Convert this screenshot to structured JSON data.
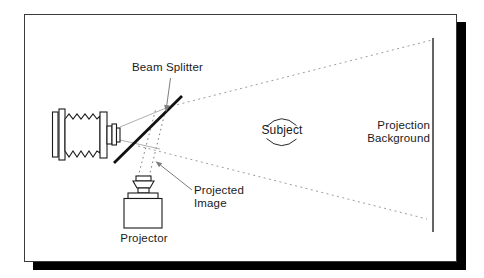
{
  "diagram": {
    "title_labels": {
      "beam_splitter": "Beam Splitter",
      "subject": "Subject",
      "projection_line1": "Projection",
      "projection_line2": "Background",
      "projected_line1": "Projected",
      "projected_line2": "Image",
      "projector": "Projector"
    },
    "colors": {
      "ink": "#1a1a1a",
      "beam_splitter_line": "#111111",
      "dotted_cone": "#9e9e9e",
      "dotted_ray": "#7a7a7a",
      "pointer_gray": "#7d7d7d",
      "sight_line": "#9a9a9a",
      "screen_line": "#4a4a4a",
      "frame_border": "#3a3a3a",
      "shadow": "#000000",
      "background": "#ffffff"
    }
  }
}
